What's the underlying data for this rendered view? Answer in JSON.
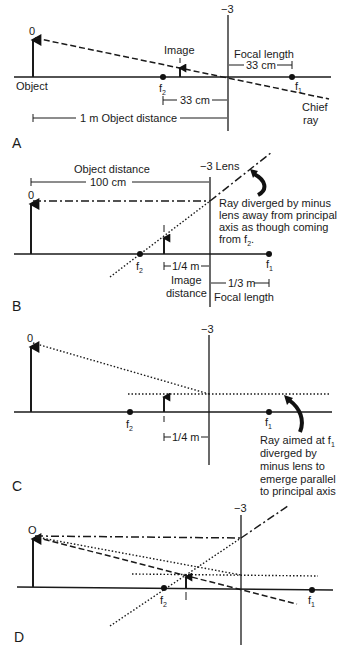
{
  "figure": {
    "panels": [
      {
        "id": "A",
        "label": "A",
        "lens_power": "−3",
        "object_label": "0",
        "object_caption": "Object",
        "image_label": "Image",
        "f2_label": "f",
        "f2_sub": "2",
        "f1_label": "f",
        "f1_sub": "1",
        "focal_length_label": "Focal length",
        "focal_length_value": "33 cm",
        "image_distance_value": "33 cm",
        "object_distance_label": "1 m Object distance",
        "chief_ray_label_1": "Chief",
        "chief_ray_label_2": "ray"
      },
      {
        "id": "B",
        "label": "B",
        "lens_power": "−3 Lens",
        "object_label": "0",
        "image_label": "I",
        "object_distance_label": "Object distance",
        "object_distance_value": "100 cm",
        "f2_label": "f",
        "f2_sub": "2",
        "f1_label": "f",
        "f1_sub": "1",
        "image_distance_value": "1/4 m",
        "image_distance_label_1": "Image",
        "image_distance_label_2": "distance",
        "focal_length_value": "1/3 m",
        "focal_length_label": "Focal length",
        "annotation_lines": [
          "Ray diverged by minus",
          "lens away from principal",
          "axis as though coming",
          "from f"
        ],
        "annotation_sub": "2",
        "annotation_end": "."
      },
      {
        "id": "C",
        "label": "C",
        "lens_power": "−3",
        "object_label": "0",
        "image_label": "I",
        "f2_label": "f",
        "f2_sub": "2",
        "f1_label": "f",
        "f1_sub": "1",
        "image_distance_value": "1/4 m",
        "annotation_first": "Ray aimed at f",
        "annotation_first_sub": "1",
        "annotation_lines": [
          "diverged by",
          "minus lens to",
          "emerge parallel",
          "to principal axis"
        ]
      },
      {
        "id": "D",
        "label": "D",
        "lens_power": "−3",
        "object_label": "O",
        "image_label": "I",
        "f2_label": "f",
        "f2_sub": "2",
        "f1_label": "f",
        "f1_sub": "1"
      }
    ]
  }
}
